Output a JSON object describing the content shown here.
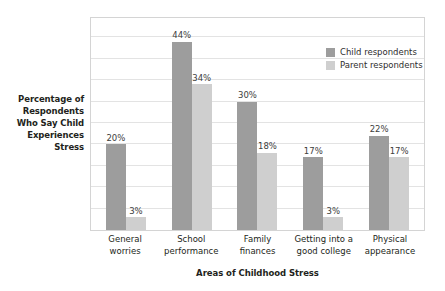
{
  "chart_data": {
    "type": "bar",
    "title": "",
    "xlabel": "Areas of Childhood Stress",
    "ylabel": "Percentage of Respondents Who Say Child Experiences Stress",
    "ylabel_lines": [
      "Percentage of",
      "Respondents",
      "Who Say Child",
      "Experiences",
      "Stress"
    ],
    "categories": [
      "General worries",
      "School performance",
      "Family finances",
      "Getting into a good college",
      "Physical appearance"
    ],
    "category_lines": [
      [
        "General",
        "worries"
      ],
      [
        "School",
        "performance"
      ],
      [
        "Family",
        "finances"
      ],
      [
        "Getting into a",
        "good college"
      ],
      [
        "Physical",
        "appearance"
      ]
    ],
    "series": [
      {
        "name": "Child respondents",
        "color": "#9d9d9d",
        "values": [
          20,
          44,
          30,
          17,
          22
        ],
        "labels": [
          "20%",
          "44%",
          "30%",
          "17%",
          "22%"
        ]
      },
      {
        "name": "Parent respondents",
        "color": "#cfcfcf",
        "values": [
          3,
          34,
          18,
          3,
          17
        ],
        "labels": [
          "3%",
          "34%",
          "18%",
          "3%",
          "17%"
        ]
      }
    ],
    "ylim": [
      0,
      50
    ],
    "y_tick_interval": 5,
    "y_ticks_visible": false,
    "grid": true,
    "grid_color": "#e3e3e3",
    "legend_position": "top-right",
    "legend": [
      {
        "label": "Child respondents",
        "color": "#9d9d9d"
      },
      {
        "label": "Parent respondents",
        "color": "#cfcfcf"
      }
    ]
  }
}
